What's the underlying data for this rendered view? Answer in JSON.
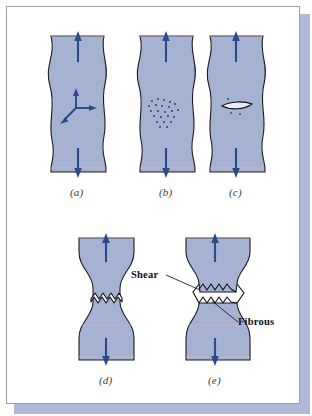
{
  "figure": {
    "background_color": "#ffffff",
    "frame_border_color": "#9aa0ab",
    "shadow_color": "#aebad8",
    "specimen_fill": "#a6b2d2",
    "specimen_outline": "#1b1b24",
    "arrow_color": "#2a4a8a",
    "crack_fill": "#ffffff",
    "label_color": "#10101a",
    "caption_color": "#3a3a42"
  },
  "panels": [
    {
      "id": "a",
      "caption": "(a)",
      "stage_name": "necking",
      "description": "Necking with triaxial stress state at the neck",
      "row": 1,
      "column": 1,
      "features": [
        "load-arrow-up",
        "load-arrow-down",
        "triaxial-stress-arrows"
      ]
    },
    {
      "id": "b",
      "caption": "(b)",
      "stage_name": "microvoid-formation",
      "description": "Cavity (microvoid) formation at the neck center",
      "row": 1,
      "column": 2,
      "features": [
        "load-arrow-up",
        "load-arrow-down",
        "microvoid-cluster"
      ],
      "microvoid_count": 23
    },
    {
      "id": "c",
      "caption": "(c)",
      "stage_name": "microvoid-coalescence",
      "description": "Coalescence of microvoids to form an elliptical crack",
      "row": 1,
      "column": 3,
      "features": [
        "load-arrow-up",
        "load-arrow-down",
        "elliptical-crack"
      ]
    },
    {
      "id": "d",
      "caption": "(d)",
      "stage_name": "crack-propagation",
      "description": "Crack propagation perpendicular to the tensile axis",
      "row": 2,
      "column": 1,
      "features": [
        "load-arrow-up",
        "load-arrow-down",
        "zigzag-crack"
      ]
    },
    {
      "id": "e",
      "caption": "(e)",
      "stage_name": "shear-fracture",
      "description": "Final shear fracture at 45 degrees producing cup-and-cone surfaces",
      "row": 2,
      "column": 2,
      "features": [
        "load-arrow-up",
        "load-arrow-down",
        "separated-fracture",
        "shear-label",
        "fibrous-label"
      ]
    }
  ],
  "annotations": [
    {
      "id": "shear",
      "text": "Shear",
      "target_panel": "e"
    },
    {
      "id": "fibrous",
      "text": "Fibrous",
      "target_panel": "e"
    }
  ]
}
